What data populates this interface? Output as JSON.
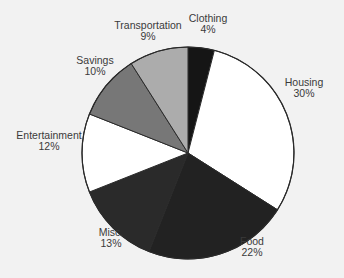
{
  "chart_data": {
    "type": "pie",
    "title": "",
    "start_angle_deg": 0,
    "direction": "clockwise",
    "slices": [
      {
        "label": "Clothing",
        "value": 4,
        "pct": "4%",
        "color": "#151515"
      },
      {
        "label": "Housing",
        "value": 30,
        "pct": "30%",
        "color": "#ffffff"
      },
      {
        "label": "Food",
        "value": 22,
        "pct": "22%",
        "color": "#222222"
      },
      {
        "label": "Misc.",
        "value": 13,
        "pct": "13%",
        "color": "#2a2a2a"
      },
      {
        "label": "Entertainment",
        "value": 12,
        "pct": "12%",
        "color": "#ffffff"
      },
      {
        "label": "Savings",
        "value": 10,
        "pct": "10%",
        "color": "#777777"
      },
      {
        "label": "Transportation",
        "value": 9,
        "pct": "9%",
        "color": "#acacac"
      }
    ]
  },
  "labels": [
    {
      "name": "Clothing",
      "pct": "4%",
      "x": 208,
      "y": 24
    },
    {
      "name": "Housing",
      "pct": "30%",
      "x": 304,
      "y": 88
    },
    {
      "name": "Food",
      "pct": "22%",
      "x": 252,
      "y": 247
    },
    {
      "name": "Misc.",
      "pct": "13%",
      "x": 111,
      "y": 238
    },
    {
      "name": "Entertainment",
      "pct": "12%",
      "x": 49,
      "y": 141
    },
    {
      "name": "Savings",
      "pct": "10%",
      "x": 95,
      "y": 66
    },
    {
      "name": "Transportation",
      "pct": "9%",
      "x": 148,
      "y": 31
    }
  ]
}
